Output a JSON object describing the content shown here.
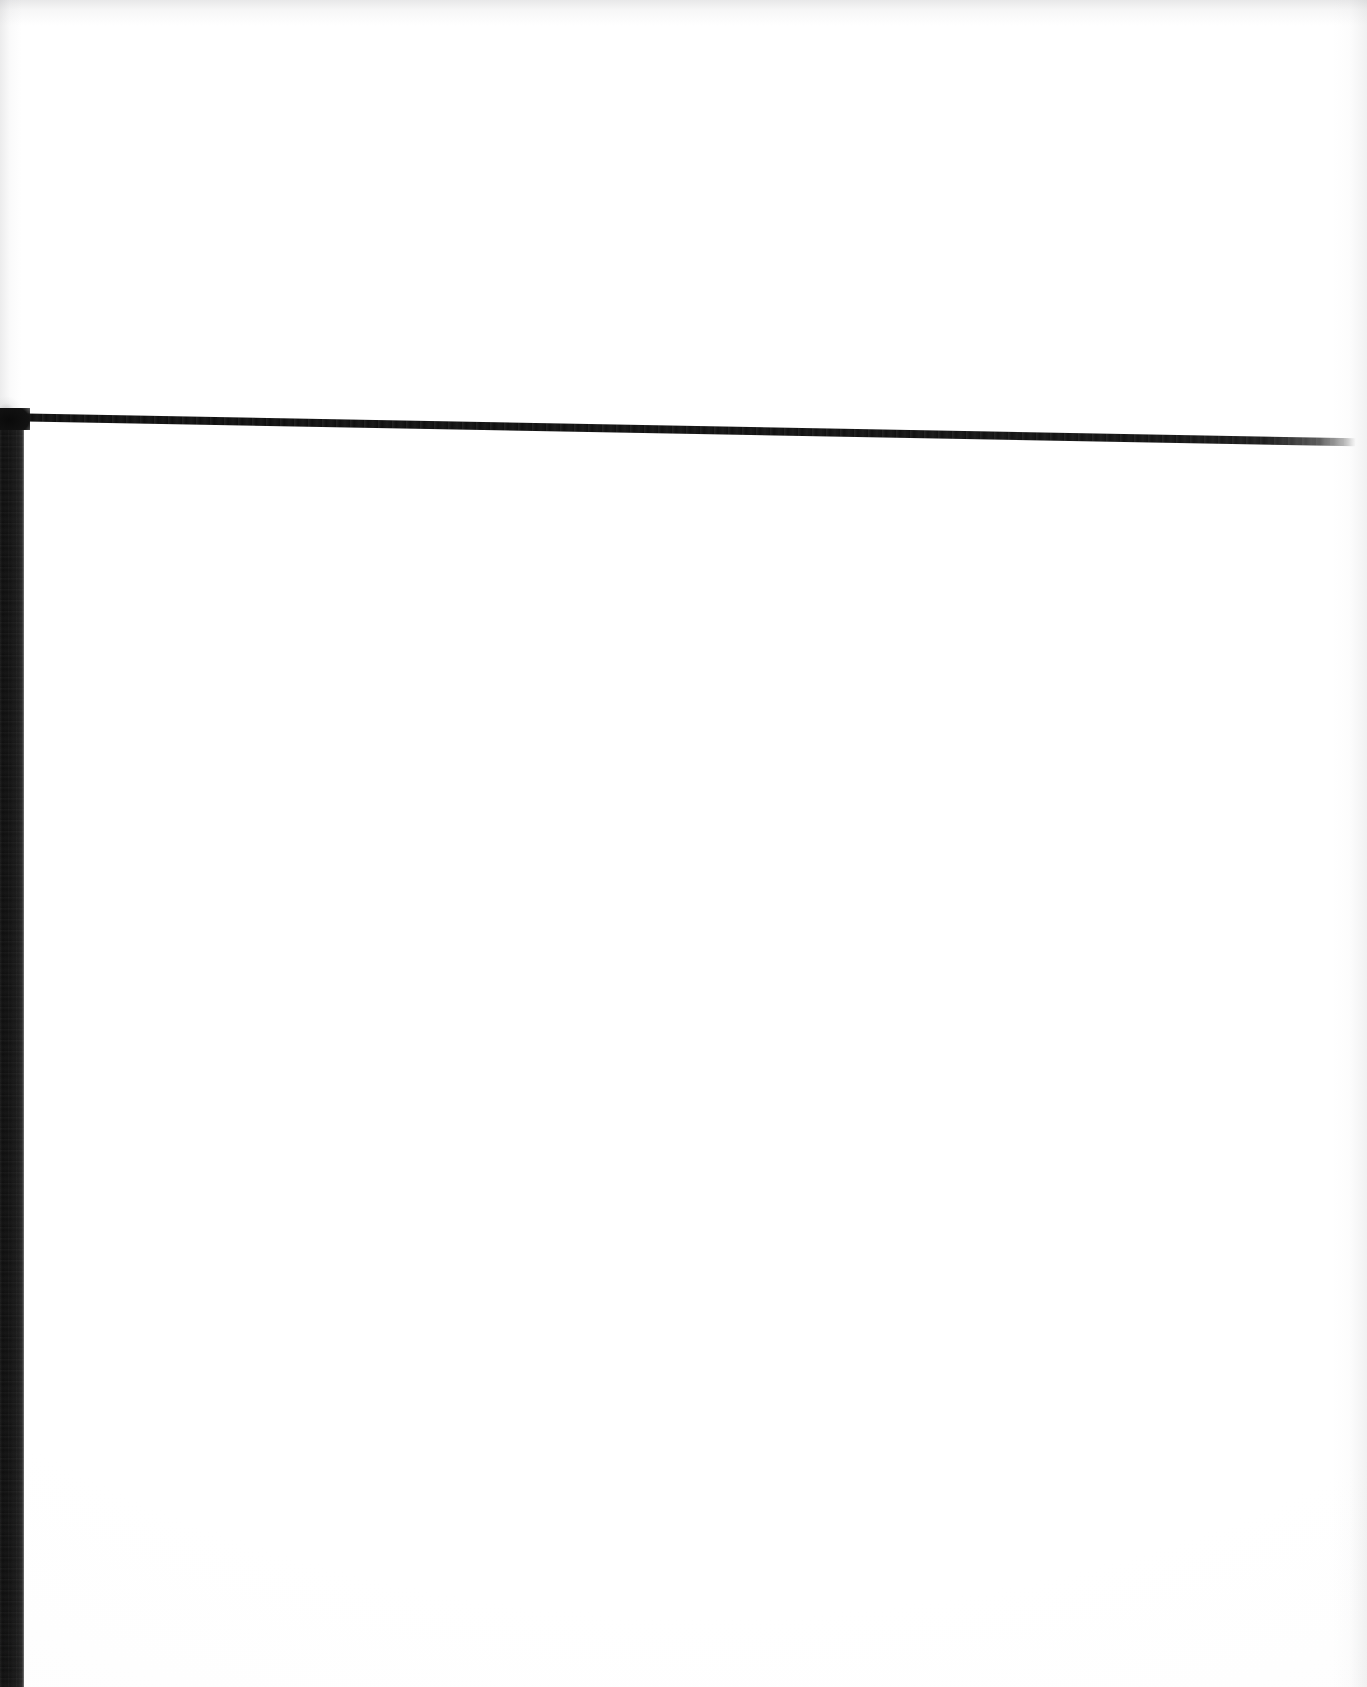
{
  "page": {
    "kind": "scanned-document-page",
    "title": "Scanned page",
    "orientation": "portrait",
    "content_state": "blank",
    "body_text": "",
    "visible_text_count": 0
  },
  "colors": {
    "paper": "#ffffff",
    "ink": "#111111",
    "band": "#0d0d0d",
    "rule": "#111111",
    "scan_shadow": "#a0a0a3"
  },
  "artifacts": {
    "left_band": {
      "name": "left margin band",
      "x": 0,
      "y": 413,
      "width": 24,
      "height": 1274
    },
    "top_rule": {
      "name": "horizontal rule",
      "x": 0,
      "y": 413,
      "width": 1356,
      "height": 8,
      "tilt_degrees": 1.07
    },
    "corner": {
      "name": "frame corner",
      "x": 24,
      "y": 415
    }
  },
  "content_well": {
    "label": "blank page area",
    "x": 24,
    "y": 421,
    "width": 1343,
    "height": 1266,
    "text": ""
  }
}
